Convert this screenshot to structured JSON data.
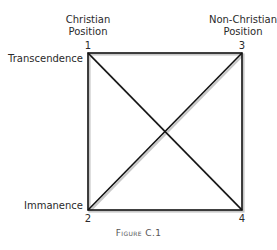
{
  "diagram": {
    "positions": {
      "christian": {
        "line1": "Christian",
        "line2": "Position"
      },
      "non_christian": {
        "line1": "Non-Christian",
        "line2": "Position"
      }
    },
    "axis_labels": {
      "top": "Transcendence",
      "bottom": "Immanence"
    },
    "corners": {
      "c1": "1",
      "c2": "2",
      "c3": "3",
      "c4": "4"
    },
    "caption": "Figure C.1",
    "colors": {
      "line": "#111111",
      "shadow": "#bdbdbd",
      "text": "#2a2a2a"
    }
  }
}
